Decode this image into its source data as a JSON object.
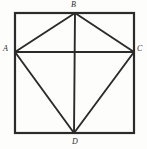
{
  "figure": {
    "type": "geometry-diagram",
    "background_color": "#fdfdfb",
    "stroke_color": "#2b2b2b",
    "label_color": "#2b2b2b",
    "square": {
      "name": "outer-square",
      "left": 15,
      "top": 13,
      "right": 134,
      "bottom": 133,
      "stroke_width": 2.2
    },
    "points": {
      "A": {
        "label": "A",
        "x": 15,
        "y": 52
      },
      "B": {
        "label": "B",
        "x": 75,
        "y": 13
      },
      "C": {
        "label": "C",
        "x": 134,
        "y": 52
      },
      "D": {
        "label": "D",
        "x": 74,
        "y": 133
      }
    },
    "segments": [
      {
        "name": "segment-AB",
        "from": "A",
        "to": "B",
        "stroke_width": 1.9
      },
      {
        "name": "segment-BC",
        "from": "B",
        "to": "C",
        "stroke_width": 1.9
      },
      {
        "name": "segment-CD",
        "from": "C",
        "to": "D",
        "stroke_width": 1.9
      },
      {
        "name": "segment-DA",
        "from": "D",
        "to": "A",
        "stroke_width": 1.9
      },
      {
        "name": "diagonal-AC",
        "from": "A",
        "to": "C",
        "stroke_width": 1.9
      },
      {
        "name": "diagonal-BD",
        "from": "B",
        "to": "D",
        "stroke_width": 1.9
      }
    ]
  }
}
